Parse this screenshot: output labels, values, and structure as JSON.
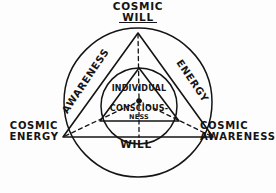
{
  "diagram": {
    "style": "hand-drawn ink sketch",
    "ink_color": "#141414",
    "background_color": "#fdfdfd",
    "outer_labels": {
      "top_line1": "COSMIC",
      "top_line2": "WILL",
      "left_line1": "COSMIC",
      "left_line2": "ENERGY",
      "right_line1": "COSMIC",
      "right_line2": "AWARENESS"
    },
    "edge_labels": {
      "left_diagonal": "AWARENESS",
      "right_diagonal": "ENERGY",
      "bottom": "WILL"
    },
    "center_labels": {
      "line1": "INDIVIDUAL",
      "line2": "CONSCIOUS-",
      "line3": "NESS"
    },
    "shapes": {
      "outer_circle": {
        "cx": 138,
        "cy": 102,
        "r": 74
      },
      "inner_circle": {
        "cx": 139,
        "cy": 106,
        "r": 38
      },
      "outer_triangle": [
        [
          138,
          33
        ],
        [
          212,
          137
        ],
        [
          64,
          137
        ]
      ],
      "inner_triangle": [
        [
          139,
          68
        ],
        [
          178,
          121
        ],
        [
          100,
          121
        ]
      ],
      "center_dot": {
        "cx": 139,
        "cy": 101,
        "r": 2.4
      }
    }
  }
}
